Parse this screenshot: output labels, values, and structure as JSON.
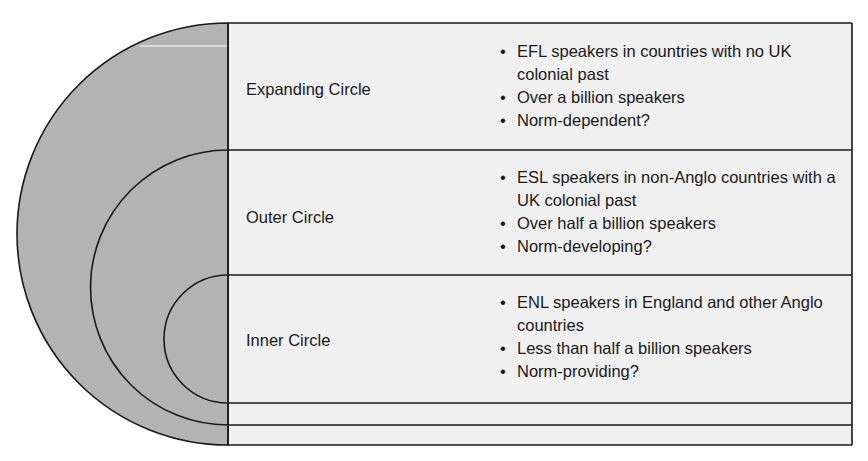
{
  "diagram": {
    "colors": {
      "shade": "#b3b3b3",
      "panel": "#f0f0f0",
      "line": "#1a1a1a"
    },
    "circles": [
      {
        "label": "Expanding Circle",
        "bullets": [
          "EFL speakers in countries with no UK colonial past",
          "Over a billion speakers",
          "Norm-dependent?"
        ]
      },
      {
        "label": "Outer Circle",
        "bullets": [
          "ESL speakers in non-Anglo countries with a UK colonial past",
          "Over half a billion speakers",
          "Norm-developing?"
        ]
      },
      {
        "label": "Inner Circle",
        "bullets": [
          "ENL speakers in England and other Anglo countries",
          "Less than half a billion speakers",
          "Norm-providing?"
        ]
      }
    ]
  }
}
